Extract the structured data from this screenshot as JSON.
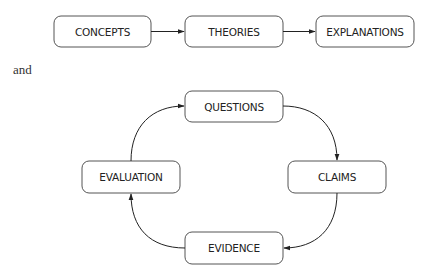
{
  "diagrams": [
    {
      "type": "linear-flow",
      "nodes": [
        {
          "id": "concepts",
          "label": "CONCEPTS"
        },
        {
          "id": "theories",
          "label": "THEORIES"
        },
        {
          "id": "explanations",
          "label": "EXPLANATIONS"
        }
      ],
      "edges": [
        {
          "from": "concepts",
          "to": "theories"
        },
        {
          "from": "theories",
          "to": "explanations"
        }
      ]
    },
    {
      "type": "cycle",
      "nodes": [
        {
          "id": "questions",
          "label": "QUESTIONS"
        },
        {
          "id": "claims",
          "label": "CLAIMS"
        },
        {
          "id": "evidence",
          "label": "EVIDENCE"
        },
        {
          "id": "evaluation",
          "label": "EVALUATION"
        }
      ],
      "edges": [
        {
          "from": "questions",
          "to": "claims"
        },
        {
          "from": "claims",
          "to": "evidence"
        },
        {
          "from": "evidence",
          "to": "evaluation"
        },
        {
          "from": "evaluation",
          "to": "questions"
        }
      ]
    }
  ],
  "conjunction": "and"
}
